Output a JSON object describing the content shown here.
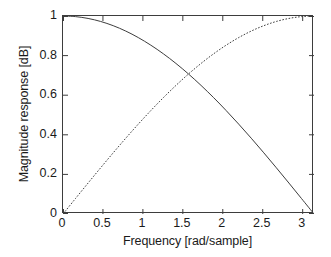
{
  "chart_data": {
    "type": "line",
    "title": "",
    "xlabel": "Frequency [rad/sample]",
    "ylabel": "Magnitude response [dB]",
    "xlim": [
      0,
      3.141592653589793
    ],
    "ylim": [
      0,
      1
    ],
    "grid": false,
    "legend": "none",
    "xticks": [
      {
        "value": 0,
        "label": "0"
      },
      {
        "value": 0.5,
        "label": "0.5"
      },
      {
        "value": 1,
        "label": "1"
      },
      {
        "value": 1.5,
        "label": "1.5"
      },
      {
        "value": 2,
        "label": "2"
      },
      {
        "value": 2.5,
        "label": "2.5"
      },
      {
        "value": 3,
        "label": "3"
      }
    ],
    "yticks": [
      {
        "value": 0,
        "label": "0"
      },
      {
        "value": 0.2,
        "label": "0.2"
      },
      {
        "value": 0.4,
        "label": "0.4"
      },
      {
        "value": 0.6,
        "label": "0.6"
      },
      {
        "value": 0.8,
        "label": "0.8"
      },
      {
        "value": 1,
        "label": "1"
      }
    ],
    "series": [
      {
        "name": "lowpass",
        "style": "solid",
        "color": "#3d3d3d",
        "formula": "cos(w/2)",
        "x": [
          0,
          0.1570796,
          0.3141593,
          0.4712389,
          0.6283185,
          0.7853982,
          0.9424778,
          1.0995574,
          1.2566371,
          1.4137167,
          1.5707963,
          1.727876,
          1.8849556,
          2.0420352,
          2.1991149,
          2.3561945,
          2.5132741,
          2.6703538,
          2.8274334,
          2.984513,
          3.1415927
        ],
        "y": [
          1.0,
          0.9969,
          0.9877,
          0.9724,
          0.9511,
          0.9239,
          0.891,
          0.8526,
          0.809,
          0.7604,
          0.7071,
          0.6494,
          0.5878,
          0.5225,
          0.454,
          0.3827,
          0.309,
          0.2334,
          0.1564,
          0.0785,
          0.0
        ]
      },
      {
        "name": "highpass",
        "style": "dashed",
        "color": "#3d3d3d",
        "formula": "sin(w/2)",
        "x": [
          0,
          0.1570796,
          0.3141593,
          0.4712389,
          0.6283185,
          0.7853982,
          0.9424778,
          1.0995574,
          1.2566371,
          1.4137167,
          1.5707963,
          1.727876,
          1.8849556,
          2.0420352,
          2.1991149,
          2.3561945,
          2.5132741,
          2.6703538,
          2.8274334,
          2.984513,
          3.1415927
        ],
        "y": [
          0.0,
          0.0785,
          0.1564,
          0.2334,
          0.309,
          0.3827,
          0.454,
          0.5225,
          0.5878,
          0.6494,
          0.7071,
          0.7604,
          0.809,
          0.8526,
          0.891,
          0.9239,
          0.9511,
          0.9724,
          0.9877,
          0.9969,
          1.0
        ]
      }
    ],
    "annotations": [
      {
        "text": "curves intersect at w = pi/2, magnitude = 0.707"
      }
    ]
  },
  "axes": {
    "frame_color": "#3d3d3d",
    "background": "#ffffff"
  }
}
